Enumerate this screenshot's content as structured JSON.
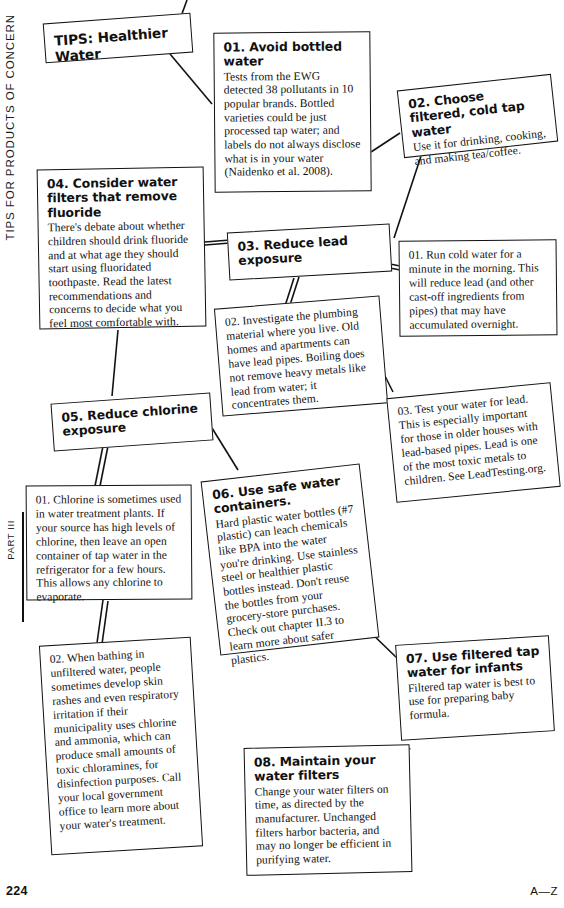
{
  "page": {
    "running_head": "TIPS FOR PRODUCTS OF CONCERN",
    "part_label": "PART III",
    "folio": "224",
    "az_mark": "A—Z"
  },
  "diagram": {
    "type": "flow-diagram",
    "root": {
      "id": "tips-healthier-water",
      "title": "TIPS: Healthier Water"
    },
    "nodes": [
      {
        "id": "tip-01",
        "title": "01. Avoid bottled water",
        "body": "Tests from the EWG detected 38 pollutants in 10 popular brands. Bottled varieties could be just processed tap water; and labels do not always disclose what is in your water (Naidenko et al. 2008)."
      },
      {
        "id": "tip-02",
        "title": "02. Choose filtered, cold tap water",
        "body": "Use it for drinking, cooking, and making tea/coffee."
      },
      {
        "id": "tip-03",
        "title": "03. Reduce lead exposure",
        "body": ""
      },
      {
        "id": "tip-03-sub-01",
        "title": "",
        "body": "01. Run cold water for a minute in the morning. This will reduce lead (and other cast-off ingredients from pipes) that may have accumulated overnight."
      },
      {
        "id": "tip-03-sub-02",
        "title": "",
        "body": "02. Investigate the plumbing material where you live. Old homes and apartments can have lead pipes. Boiling does not remove heavy metals like lead from water; it concentrates them."
      },
      {
        "id": "tip-03-sub-03",
        "title": "",
        "body": "03. Test your water for lead. This is especially important for those in older houses with lead-based pipes. Lead is one of the most toxic metals to children. See LeadTesting.org."
      },
      {
        "id": "tip-04",
        "title": "04. Consider water filters that remove fluoride",
        "body": "There's debate about whether children should drink fluoride and at what age they should start using fluoridated toothpaste. Read the latest recommendations and concerns to decide what you feel most comfortable with."
      },
      {
        "id": "tip-05",
        "title": "05. Reduce chlorine exposure",
        "body": ""
      },
      {
        "id": "tip-05-sub-01",
        "title": "",
        "body": "01. Chlorine is sometimes used in water treatment plants. If your source has high levels of chlorine, then leave an open container of tap water in the refrigerator for a few hours. This allows any chlorine to evaporate."
      },
      {
        "id": "tip-05-sub-02",
        "title": "",
        "body": "02. When bathing in unfiltered water, people sometimes develop skin rashes and even respiratory irritation if their municipality uses chlorine and ammonia, which can produce small amounts of toxic chloramines, for disinfection purposes. Call your local government office to learn more about your water's treatment."
      },
      {
        "id": "tip-06",
        "title": "06. Use safe water containers.",
        "body": "Hard plastic water bottles (#7 plastic) can leach chemicals like BPA into the water you're drinking. Use stainless steel or healthier plastic bottles instead. Don't reuse the bottles from your grocery-store purchases. Check out chapter II.3 to learn more about safer plastics."
      },
      {
        "id": "tip-07",
        "title": "07. Use filtered tap water for infants",
        "body": "Filtered tap water is best to use for preparing baby formula."
      },
      {
        "id": "tip-08",
        "title": "08. Maintain your water filters",
        "body": "Change your water filters on time, as directed by the manufacturer. Unchanged filters harbor bacteria, and may no longer be efficient in purifying water."
      }
    ]
  },
  "colors": {
    "ink": "#111111",
    "paper": "#ffffff"
  }
}
